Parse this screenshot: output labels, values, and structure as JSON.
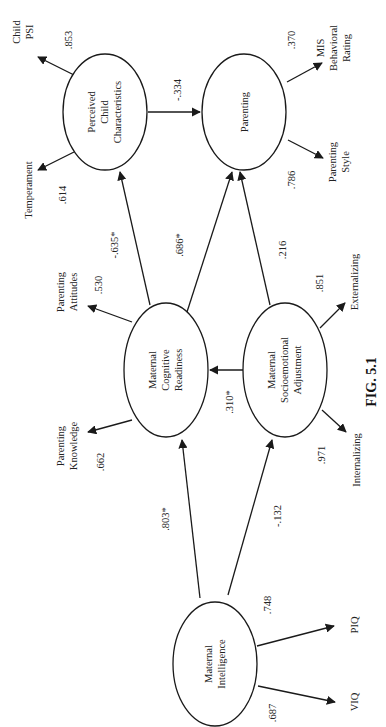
{
  "caption": "FIG. 5.1",
  "colors": {
    "stroke": "#1a1a1a",
    "text": "#222222",
    "background": "#ffffff"
  },
  "latent": {
    "perceived_child": {
      "line1": "Perceived",
      "line2": "Child",
      "line3": "Characteristics"
    },
    "parenting": {
      "line1": "Parenting"
    },
    "cognitive": {
      "line1": "Maternal",
      "line2": "Cognitive",
      "line3": "Readiness"
    },
    "socioemotional": {
      "line1": "Maternal",
      "line2": "Socioemotional",
      "line3": "Adjustment"
    },
    "intelligence": {
      "line1": "Maternal",
      "line2": "Intelligence"
    }
  },
  "indicators": {
    "child_psi": {
      "line1": "Child",
      "line2": "PSI",
      "loading": ".853"
    },
    "temperament": {
      "line1": "Temperament",
      "loading": ".614"
    },
    "mis": {
      "line1": "MIS",
      "line2": "Behavioral",
      "line3": "Rating",
      "loading": ".370"
    },
    "parenting_style": {
      "line1": "Parenting",
      "line2": "Style",
      "loading": ".786"
    },
    "parenting_attitudes": {
      "line1": "Parenting",
      "line2": "Attitudes",
      "loading": ".530"
    },
    "parenting_knowledge": {
      "line1": "Parenting",
      "line2": "Knowledge",
      "loading": ".662"
    },
    "externalizing": {
      "line1": "Externalizing",
      "loading": ".851"
    },
    "internalizing": {
      "line1": "Internalizing",
      "loading": ".971"
    },
    "piq": {
      "line1": "PIQ",
      "loading": ".748"
    },
    "viq": {
      "line1": "VIQ",
      "loading": ".687"
    }
  },
  "paths": {
    "perceived_to_parenting": "-.334",
    "cognitive_to_perceived": "-.635*",
    "cognitive_to_parenting": ".686*",
    "socio_to_parenting": ".216",
    "socio_to_cognitive": ".310*",
    "intel_to_cognitive": ".803*",
    "intel_to_socio": "-.132"
  }
}
